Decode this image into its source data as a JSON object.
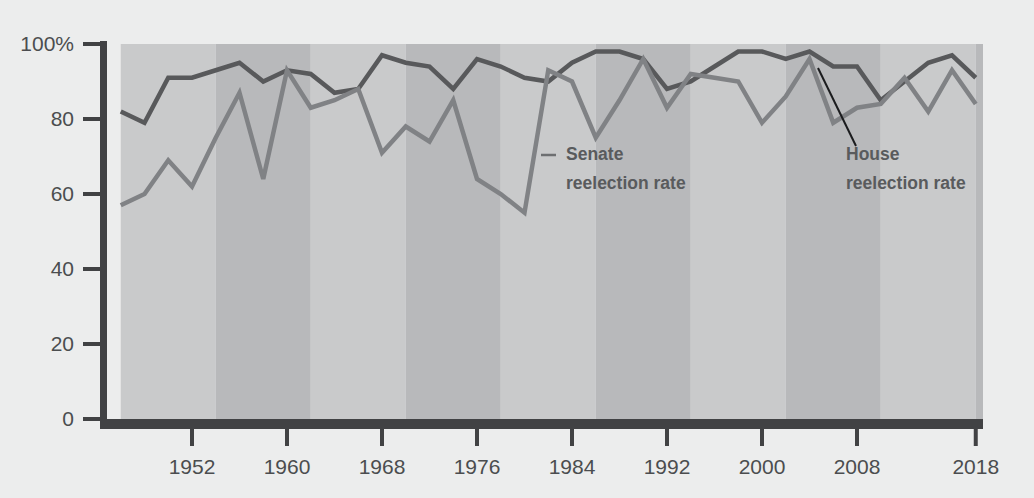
{
  "chart_data": {
    "type": "line",
    "title": "",
    "subtitle": "",
    "xlabel": "",
    "ylabel": "",
    "xlim": [
      1946,
      2018
    ],
    "ylim": [
      0,
      100
    ],
    "grid": false,
    "legend_position": "inline-annotations",
    "y_ticks": [
      {
        "value": 100,
        "label": "100%"
      },
      {
        "value": 80,
        "label": "80"
      },
      {
        "value": 60,
        "label": "60"
      },
      {
        "value": 40,
        "label": "40"
      },
      {
        "value": 20,
        "label": "20"
      },
      {
        "value": 0,
        "label": "0"
      }
    ],
    "x_ticks": [
      {
        "value": 1952,
        "label": "1952"
      },
      {
        "value": 1960,
        "label": "1960"
      },
      {
        "value": 1968,
        "label": "1968"
      },
      {
        "value": 1976,
        "label": "1976"
      },
      {
        "value": 1984,
        "label": "1984"
      },
      {
        "value": 1992,
        "label": "1992"
      },
      {
        "value": 2000,
        "label": "2000"
      },
      {
        "value": 2008,
        "label": "2008"
      },
      {
        "value": 2018,
        "label": "2018"
      }
    ],
    "x": [
      1946,
      1948,
      1950,
      1952,
      1954,
      1956,
      1958,
      1960,
      1962,
      1964,
      1966,
      1968,
      1970,
      1972,
      1974,
      1976,
      1978,
      1980,
      1982,
      1984,
      1986,
      1988,
      1990,
      1992,
      1994,
      1996,
      1998,
      2000,
      2002,
      2004,
      2006,
      2008,
      2010,
      2012,
      2014,
      2016,
      2018
    ],
    "series": [
      {
        "name": "House reelection rate",
        "color": "#58595b",
        "values": [
          82,
          79,
          91,
          91,
          93,
          95,
          90,
          93,
          92,
          87,
          88,
          97,
          95,
          94,
          88,
          96,
          94,
          91,
          90,
          95,
          98,
          98,
          96,
          88,
          90,
          94,
          98,
          98,
          96,
          98,
          94,
          94,
          85,
          90,
          95,
          97,
          91
        ]
      },
      {
        "name": "Senate reelection rate",
        "color": "#808285",
        "values": [
          57,
          60,
          69,
          62,
          75,
          87,
          64,
          93,
          83,
          85,
          88,
          71,
          78,
          74,
          85,
          64,
          60,
          55,
          93,
          90,
          75,
          85,
          96,
          83,
          92,
          91,
          90,
          79,
          86,
          96,
          79,
          83,
          84,
          91,
          82,
          93,
          84
        ]
      }
    ],
    "annotations": [
      {
        "text_line1": "Senate",
        "text_line2": "reelection rate",
        "label_x": 566,
        "label_y": 160,
        "leader": {
          "x1": 541,
          "y1": 155,
          "x2": 556,
          "y2": 155,
          "style": "horizontal-dash"
        }
      },
      {
        "text_line1": "House",
        "text_line2": "reelection rate",
        "label_x": 846,
        "label_y": 160,
        "leader": {
          "x1": 856,
          "y1": 146,
          "x2": 818,
          "y2": 68,
          "style": "diagonal"
        }
      }
    ],
    "bands": {
      "period_years": 8,
      "start_year": 1946,
      "color_light": "#c9cacb",
      "color_dark": "#b8b9bb"
    },
    "axis_color": "#414244",
    "background": "#eceded"
  }
}
